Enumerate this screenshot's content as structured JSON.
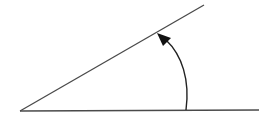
{
  "diagram": {
    "type": "angle",
    "colors": {
      "line": "#4a4a4a",
      "background": "#ffffff"
    },
    "vertex": {
      "x": 20,
      "y": 111
    },
    "horizontal_ray_end": {
      "x": 259,
      "y": 110
    },
    "inclined_ray_end": {
      "x": 204,
      "y": 5
    },
    "arc": {
      "start": {
        "x": 186,
        "y": 110
      },
      "end": {
        "x": 159,
        "y": 35
      },
      "direction": "counterclockwise"
    }
  }
}
